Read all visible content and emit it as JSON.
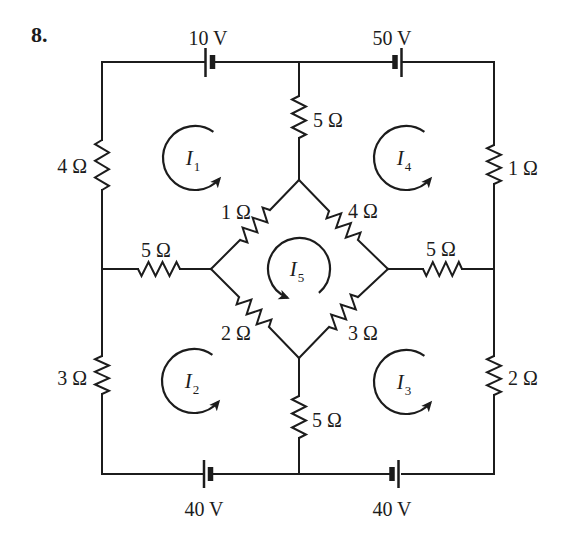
{
  "problem_number": "8.",
  "sources": {
    "top_left": {
      "label": "10 V"
    },
    "top_right": {
      "label": "50 V"
    },
    "bottom_left": {
      "label": "40 V"
    },
    "bottom_right": {
      "label": "40 V"
    }
  },
  "resistors": {
    "outer_left_top": "4 Ω",
    "outer_left_bottom": "3 Ω",
    "outer_right_top": "1 Ω",
    "outer_right_bottom": "2 Ω",
    "center_top": "5 Ω",
    "center_bottom": "5 Ω",
    "mid_left": "5 Ω",
    "mid_right": "5 Ω",
    "bridge_upper_left": "1 Ω",
    "bridge_upper_right": "4 Ω",
    "bridge_lower_left": "2 Ω",
    "bridge_lower_right": "3 Ω"
  },
  "loop_currents": {
    "i1": {
      "symbol": "I",
      "sub": "1"
    },
    "i2": {
      "symbol": "I",
      "sub": "2"
    },
    "i3": {
      "symbol": "I",
      "sub": "3"
    },
    "i4": {
      "symbol": "I",
      "sub": "4"
    },
    "i5": {
      "symbol": "I",
      "sub": "5"
    }
  },
  "colors": {
    "ink": "#1c1c1c",
    "background": "#ffffff"
  }
}
